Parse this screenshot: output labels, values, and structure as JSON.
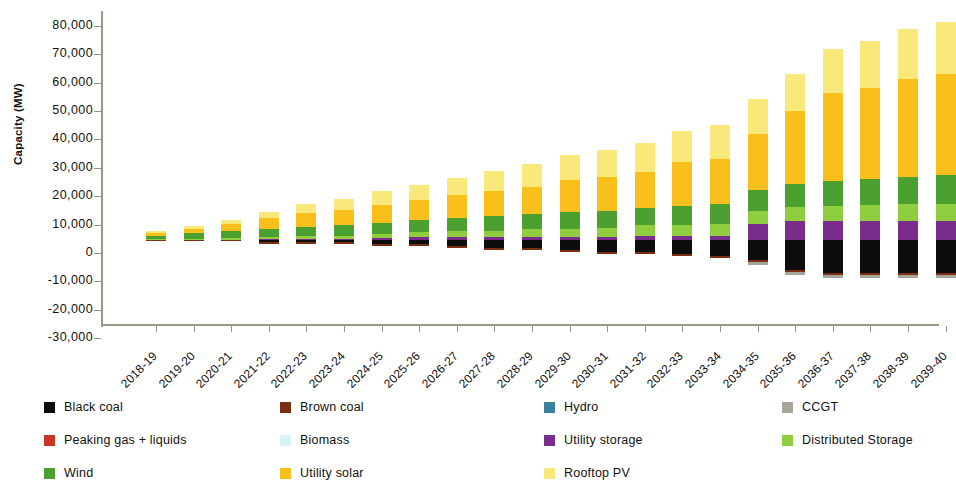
{
  "chart_data": {
    "type": "bar",
    "title": "",
    "subtitle": "",
    "xlabel": "",
    "ylabel": "Capacity (MW)",
    "ylim": [
      -30000,
      80000
    ],
    "ytick_step": 10000,
    "ytick_labels": [
      "80,000",
      "70,000",
      "60,000",
      "50,000",
      "40,000",
      "30,000",
      "20,000",
      "10,000",
      "0",
      "-10,000",
      "-20,000",
      "-30,000"
    ],
    "ytick_values": [
      80000,
      70000,
      60000,
      50000,
      40000,
      30000,
      20000,
      10000,
      0,
      -10000,
      -20000,
      -30000
    ],
    "grid": false,
    "stacked": true,
    "legend_position": "bottom",
    "categories": [
      "2018-19",
      "2019-20",
      "2020-21",
      "2021-22",
      "2022-23",
      "2023-24",
      "2024-25",
      "2025-26",
      "2026-27",
      "2027-28",
      "2028-29",
      "2029-30",
      "2030-31",
      "2031-32",
      "2032-33",
      "2033-34",
      "2034-35",
      "2035-36",
      "2036-37",
      "2037-38",
      "2038-39",
      "2039-40"
    ],
    "series": [
      {
        "name": "Black coal",
        "color": "#0d0d0d",
        "values": [
          0,
          0,
          0,
          -700,
          -700,
          -700,
          -1400,
          -1400,
          -2100,
          -2800,
          -2800,
          -3500,
          -4200,
          -4200,
          -4900,
          -5600,
          -7000,
          -10500,
          -11500,
          -11500,
          -11500,
          -11500
        ]
      },
      {
        "name": "Brown coal",
        "color": "#7a2e12",
        "values": [
          -400,
          -400,
          -400,
          -600,
          -600,
          -600,
          -600,
          -600,
          -600,
          -600,
          -600,
          -600,
          -900,
          -900,
          -900,
          -900,
          -900,
          -900,
          -900,
          -900,
          -900,
          -900
        ]
      },
      {
        "name": "Hydro",
        "color": "#3d7f9e",
        "values": [
          0,
          0,
          0,
          0,
          0,
          0,
          0,
          0,
          0,
          0,
          0,
          0,
          0,
          0,
          0,
          0,
          0,
          0,
          0,
          0,
          0,
          0
        ]
      },
      {
        "name": "CCGT",
        "color": "#a8a49a",
        "values": [
          0,
          0,
          0,
          0,
          0,
          0,
          0,
          0,
          0,
          0,
          0,
          0,
          0,
          0,
          0,
          0,
          -900,
          -900,
          -900,
          -900,
          -900,
          -900
        ]
      },
      {
        "name": "Peaking gas + liquids",
        "color": "#c93626",
        "values": [
          0,
          0,
          0,
          0,
          0,
          0,
          0,
          0,
          0,
          0,
          0,
          0,
          0,
          0,
          0,
          0,
          0,
          0,
          0,
          0,
          0,
          0
        ]
      },
      {
        "name": "Biomass",
        "color": "#d9f2f4",
        "values": [
          0,
          0,
          0,
          0,
          0,
          0,
          0,
          0,
          0,
          0,
          0,
          0,
          0,
          0,
          0,
          0,
          0,
          0,
          0,
          0,
          0,
          0
        ]
      },
      {
        "name": "Utility storage",
        "color": "#7b2d8e",
        "values": [
          0,
          0,
          0,
          300,
          300,
          300,
          600,
          900,
          900,
          900,
          1000,
          1000,
          1000,
          1400,
          1400,
          1400,
          5600,
          6700,
          6700,
          6700,
          6700,
          6700
        ]
      },
      {
        "name": "Distributed Storage",
        "color": "#8fcf3f",
        "values": [
          200,
          300,
          500,
          700,
          1000,
          1200,
          1500,
          1800,
          2100,
          2400,
          2700,
          3000,
          3300,
          3700,
          4000,
          4300,
          4600,
          4900,
          5200,
          5500,
          5800,
          6000
        ]
      },
      {
        "name": "Wind",
        "color": "#4ba02f",
        "values": [
          1200,
          2000,
          2600,
          3000,
          3400,
          3700,
          4000,
          4300,
          4700,
          5000,
          5300,
          5700,
          6000,
          6300,
          6600,
          6900,
          7500,
          8200,
          8800,
          9300,
          9800,
          10200
        ]
      },
      {
        "name": "Utility solar",
        "color": "#f9c01c",
        "values": [
          900,
          1500,
          2400,
          3800,
          4800,
          5500,
          6300,
          7000,
          8000,
          8800,
          9800,
          11500,
          12000,
          12500,
          15500,
          16000,
          19500,
          25500,
          31000,
          32000,
          34500,
          35500
        ]
      },
      {
        "name": "Rooftop PV",
        "color": "#f9e87a",
        "values": [
          800,
          1000,
          1600,
          2200,
          3000,
          3800,
          4700,
          5500,
          6300,
          7100,
          7900,
          8800,
          9500,
          10200,
          11000,
          11800,
          12500,
          13200,
          15500,
          16500,
          17500,
          18500
        ]
      }
    ],
    "legend_entries": [
      {
        "label": "Black coal",
        "color": "#0d0d0d"
      },
      {
        "label": "Brown coal",
        "color": "#7a2e12"
      },
      {
        "label": "Hydro",
        "color": "#3d7f9e"
      },
      {
        "label": "CCGT",
        "color": "#a8a49a"
      },
      {
        "label": "Peaking gas + liquids",
        "color": "#c93626"
      },
      {
        "label": "Biomass",
        "color": "#d9f2f4"
      },
      {
        "label": "Utility storage",
        "color": "#7b2d8e"
      },
      {
        "label": "Distributed Storage",
        "color": "#8fcf3f"
      },
      {
        "label": "Wind",
        "color": "#4ba02f"
      },
      {
        "label": "Utility solar",
        "color": "#f9c01c"
      },
      {
        "label": "Rooftop PV",
        "color": "#f9e87a"
      }
    ]
  },
  "axis": {
    "line_color": "#9c9684"
  }
}
